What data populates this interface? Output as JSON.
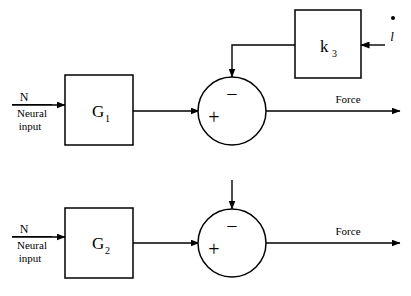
{
  "diagram": {
    "stroke_color": "#000000",
    "background_color": "#ffffff",
    "rows": [
      {
        "id": "row-1",
        "input": {
          "symbol": "N",
          "caption_line1": "Neural",
          "caption_line2": "input"
        },
        "block": {
          "base": "G",
          "subscript": "1"
        },
        "summing_junction": {
          "plus_sign": "+",
          "minus_sign": "−"
        },
        "feedback_block": {
          "base": "k",
          "subscript": "3"
        },
        "feedback_input": {
          "symbol": "l",
          "accent": "dot"
        },
        "output": {
          "label": "Force"
        }
      },
      {
        "id": "row-2",
        "input": {
          "symbol": "N",
          "caption_line1": "Neural",
          "caption_line2": "input"
        },
        "block": {
          "base": "G",
          "subscript": "2"
        },
        "summing_junction": {
          "plus_sign": "+",
          "minus_sign": "−"
        },
        "feedback_block": null,
        "feedback_input": null,
        "output": {
          "label": "Force"
        }
      }
    ]
  }
}
